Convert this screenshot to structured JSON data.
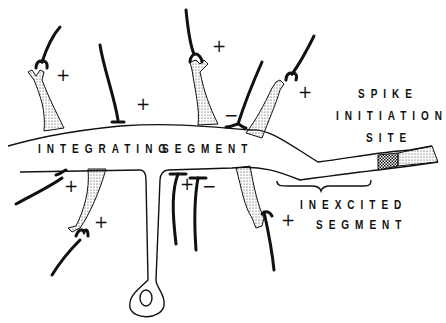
{
  "diagram": {
    "labels": {
      "integrating": "INTEGRATING",
      "segment": "SEGMENT",
      "spike_line1": "SPIKE",
      "spike_line2": "INITIATION",
      "spike_line3": "SITE",
      "inexcited_line1": "INEXCITED",
      "inexcited_line2": "SEGMENT"
    },
    "synapse_signs": [
      {
        "sign": "+",
        "x": 56,
        "y": 67
      },
      {
        "sign": "+",
        "x": 136,
        "y": 96
      },
      {
        "sign": "+",
        "x": 212,
        "y": 38
      },
      {
        "sign": "−",
        "x": 224,
        "y": 107
      },
      {
        "sign": "+",
        "x": 298,
        "y": 84
      },
      {
        "sign": "+",
        "x": 64,
        "y": 178
      },
      {
        "sign": "+",
        "x": 94,
        "y": 214
      },
      {
        "sign": "+",
        "x": 180,
        "y": 176
      },
      {
        "sign": "−",
        "x": 202,
        "y": 178
      },
      {
        "sign": "+",
        "x": 281,
        "y": 212
      }
    ],
    "colors": {
      "ink": "#111111",
      "background": "#ffffff"
    }
  }
}
